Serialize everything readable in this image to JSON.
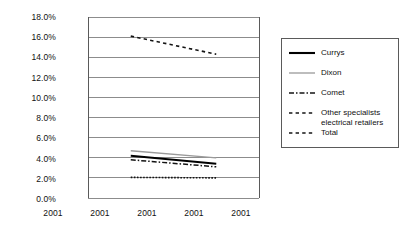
{
  "chart_data": {
    "type": "line",
    "title": "",
    "xlabel": "",
    "ylabel": "",
    "ylim": [
      0,
      18
    ],
    "ytick_step": 2,
    "yticks": [
      "0.0%",
      "2.0%",
      "4.0%",
      "6.0%",
      "8.0%",
      "10.0%",
      "12.0%",
      "14.0%",
      "16.0%",
      "18.0%"
    ],
    "categories": [
      "2001",
      "2001",
      "2001",
      "2001",
      "2001"
    ],
    "x": [
      1,
      2,
      3,
      4,
      5
    ],
    "grid": true,
    "legend_position": "right",
    "data_x_range": [
      2,
      4
    ],
    "series": [
      {
        "name": "Currys",
        "style": "solid",
        "color": "#000000",
        "width": 2.0,
        "x": [
          2,
          4
        ],
        "values": [
          4.2,
          3.4
        ]
      },
      {
        "name": "Dixon",
        "style": "solid",
        "color": "#9a9a9a",
        "width": 1.3,
        "x": [
          2,
          4
        ],
        "values": [
          4.7,
          4.0
        ]
      },
      {
        "name": "Comet",
        "style": "dashdot",
        "color": "#141414",
        "width": 1.5,
        "x": [
          2,
          4
        ],
        "values": [
          3.8,
          3.1
        ]
      },
      {
        "name": "Other specialists electrical retailers",
        "style": "dotted",
        "color": "#141414",
        "width": 1.6,
        "x": [
          2,
          4
        ],
        "values": [
          2.05,
          2.0
        ]
      },
      {
        "name": "Total",
        "style": "dashed",
        "color": "#141414",
        "width": 1.6,
        "x": [
          2,
          4
        ],
        "values": [
          16.1,
          14.3
        ]
      }
    ]
  },
  "legend": {
    "items": [
      {
        "label": "Currys",
        "label2": ""
      },
      {
        "label": "Dixon",
        "label2": ""
      },
      {
        "label": "Comet",
        "label2": ""
      },
      {
        "label": "Other specialists",
        "label2": "electrical retailers"
      },
      {
        "label": "Total",
        "label2": ""
      }
    ]
  },
  "axis": {
    "y_ticks": [
      "18.0%",
      "16.0%",
      "14.0%",
      "12.0%",
      "10.0%",
      "8.0%",
      "6.0%",
      "4.0%",
      "2.0%",
      "0.0%"
    ],
    "x_ticks": [
      "2001",
      "2001",
      "2001",
      "2001",
      "2001"
    ]
  }
}
